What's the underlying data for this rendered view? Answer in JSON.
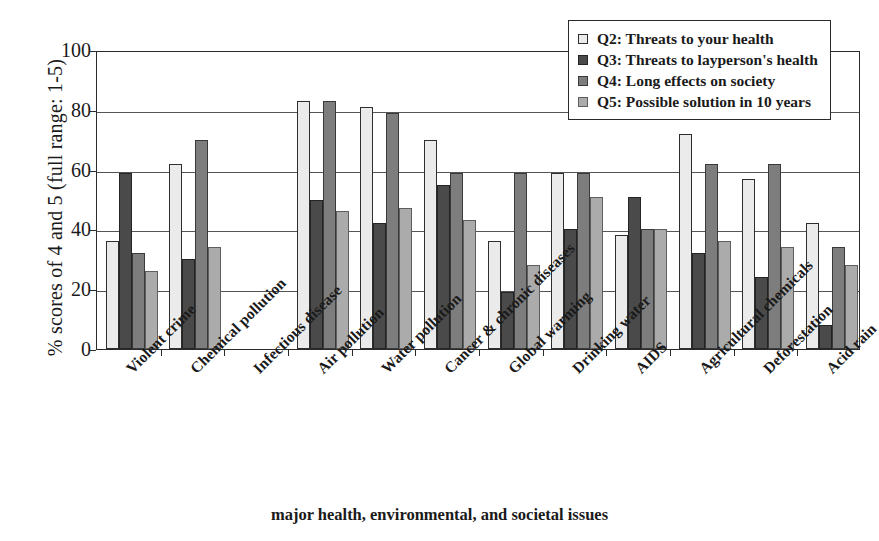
{
  "chart_data": {
    "type": "bar",
    "title": "",
    "xlabel": "major health, environmental, and societal issues",
    "ylabel": "% scores of 4 and 5 (full range: 1-5)",
    "ylim": [
      0,
      100
    ],
    "yticks": [
      0,
      20,
      40,
      60,
      80,
      100
    ],
    "grid": true,
    "legend_position": "top-right",
    "categories": [
      "Violent crime",
      "Chemical pollution",
      "Infectious disease",
      "Air pollution",
      "Water pollution",
      "Cancer & chronic diseases",
      "Global warming",
      "Drinking water",
      "AIDS",
      "Agricultural chemicals",
      "Deforestation",
      "Acid rain"
    ],
    "series": [
      {
        "name": "Q2: Threats to your health",
        "color": "#ebebeb",
        "values": [
          36,
          62,
          null,
          83,
          81,
          70,
          36,
          59,
          38,
          72,
          57,
          42
        ]
      },
      {
        "name": "Q3: Threats to layperson's health",
        "color": "#4a4a4a",
        "values": [
          59,
          30,
          null,
          50,
          42,
          55,
          19,
          40,
          51,
          32,
          24,
          8
        ]
      },
      {
        "name": "Q4: Long effects on society",
        "color": "#7d7d7d",
        "values": [
          32,
          70,
          null,
          83,
          79,
          59,
          59,
          59,
          40,
          62,
          62,
          34
        ]
      },
      {
        "name": "Q5: Possible solution in 10 years",
        "color": "#ababab",
        "values": [
          26,
          34,
          null,
          46,
          47,
          43,
          28,
          51,
          40,
          36,
          34,
          28
        ]
      }
    ]
  },
  "legend": {
    "items": [
      {
        "label": "Q2: Threats to your health",
        "swatch": "legend-swatch-q2"
      },
      {
        "label": "Q3: Threats to layperson's health",
        "swatch": "legend-swatch-q3"
      },
      {
        "label": "Q4: Long effects on society",
        "swatch": "legend-swatch-q4"
      },
      {
        "label": "Q5: Possible solution in 10 years",
        "swatch": "legend-swatch-q5"
      }
    ]
  }
}
